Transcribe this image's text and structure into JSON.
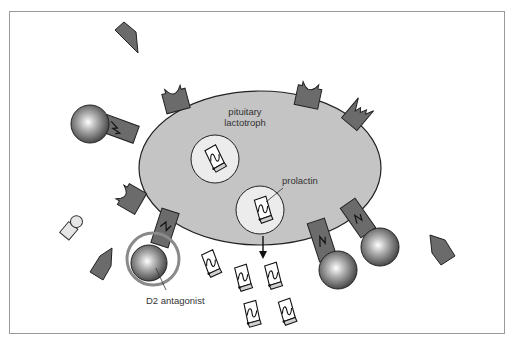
{
  "diagram": {
    "cell_label_line1": "pituitary",
    "cell_label_line2": "lactotroph",
    "prolactin_label": "prolactin",
    "antagonist_label": "D2 antagonist"
  },
  "colors": {
    "cell_fill": "#c4c4c4",
    "receptor_fill": "#6b6b6b",
    "ligand_fill": "#6e6e6e",
    "vesicle_fill": "#ececec",
    "ring_stroke": "#8a8a8a",
    "frame_stroke": "#9a9a9a"
  }
}
